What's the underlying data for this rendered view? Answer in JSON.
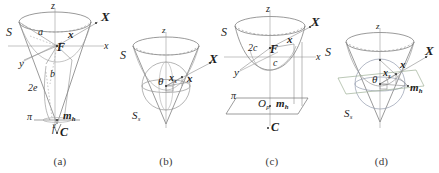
{
  "figure": {
    "background": "#ffffff",
    "ink": "#2b2b2b",
    "faint_ink": "#8f8f8f",
    "accent_blue": "#8fa6c4",
    "accent_green": "#a9bda4"
  },
  "panels": [
    {
      "id": "a",
      "caption": "(a)",
      "description": "Cone with apex at C, focus F, axes x, y, z, tangent sphere parameters a, b, 2e, and horizontal plane pi with m_h",
      "labels": [
        {
          "key": "z_axis",
          "text": "z",
          "style": "italic"
        },
        {
          "key": "x_axis",
          "text": "x",
          "style": "italic"
        },
        {
          "key": "y_axis",
          "text": "y",
          "style": "italic"
        },
        {
          "key": "S",
          "text": "S",
          "style": "italic"
        },
        {
          "key": "X",
          "text": "X",
          "style": "bold-italic"
        },
        {
          "key": "x_vec",
          "text": "x",
          "style": "bold-italic"
        },
        {
          "key": "F",
          "text": "F",
          "style": "bold-italic"
        },
        {
          "key": "a",
          "text": "a",
          "style": "italic"
        },
        {
          "key": "b",
          "text": "b",
          "style": "italic"
        },
        {
          "key": "two_e",
          "text": "2e",
          "style": "italic"
        },
        {
          "key": "pi",
          "text": "π",
          "style": "italic"
        },
        {
          "key": "m_h",
          "base": "m",
          "sub": "h",
          "style": "bold-italic"
        },
        {
          "key": "f",
          "text": "f",
          "style": "italic"
        },
        {
          "key": "C",
          "text": "C",
          "style": "bold-italic"
        }
      ]
    },
    {
      "id": "b",
      "caption": "(b)",
      "description": "Cone S with inscribed sphere S_s, half-angle theta, points x_s and x, direction X, axis z",
      "labels": [
        {
          "key": "z_axis",
          "text": "z",
          "style": "italic"
        },
        {
          "key": "S",
          "text": "S",
          "style": "italic"
        },
        {
          "key": "S_s",
          "base": "S",
          "sub": "s",
          "style": "italic"
        },
        {
          "key": "theta",
          "text": "θ",
          "style": "italic"
        },
        {
          "key": "x_s",
          "base": "x",
          "sub": "s",
          "style": "bold-italic"
        },
        {
          "key": "x_vec",
          "text": "x",
          "style": "bold-italic"
        },
        {
          "key": "X",
          "text": "X",
          "style": "bold-italic"
        }
      ]
    },
    {
      "id": "c",
      "caption": "(c)",
      "description": "Cone S with focus F, parameters 2c and c, axes x, y, z, plane pi containing O_p and m_h, apex C",
      "labels": [
        {
          "key": "z_axis",
          "text": "z",
          "style": "italic"
        },
        {
          "key": "x_axis",
          "text": "x",
          "style": "italic"
        },
        {
          "key": "y_axis",
          "text": "y",
          "style": "italic"
        },
        {
          "key": "S",
          "text": "S",
          "style": "italic"
        },
        {
          "key": "X",
          "text": "X",
          "style": "bold-italic"
        },
        {
          "key": "x_vec",
          "text": "x",
          "style": "bold-italic"
        },
        {
          "key": "F",
          "text": "F",
          "style": "bold-italic"
        },
        {
          "key": "two_c",
          "text": "2c",
          "style": "italic"
        },
        {
          "key": "c",
          "text": "c",
          "style": "italic"
        },
        {
          "key": "pi",
          "text": "π",
          "style": "italic"
        },
        {
          "key": "O_p",
          "base": "O",
          "sub": "p",
          "style": "italic"
        },
        {
          "key": "m_h",
          "base": "m",
          "sub": "h",
          "style": "bold-italic"
        },
        {
          "key": "C",
          "text": "C",
          "style": "bold-italic"
        }
      ]
    },
    {
      "id": "d",
      "caption": "(d)",
      "description": "Cone S with inscribed sphere S_s and plane, angle theta, points x_s, x, m_h, direction X, axis z",
      "labels": [
        {
          "key": "z_axis",
          "text": "z",
          "style": "italic"
        },
        {
          "key": "S",
          "text": "S",
          "style": "italic"
        },
        {
          "key": "S_s",
          "base": "S",
          "sub": "s",
          "style": "italic"
        },
        {
          "key": "theta",
          "text": "θ",
          "style": "italic"
        },
        {
          "key": "x_s",
          "base": "x",
          "sub": "s",
          "style": "bold-italic"
        },
        {
          "key": "x_vec",
          "text": "x",
          "style": "bold-italic"
        },
        {
          "key": "X",
          "text": "X",
          "style": "bold-italic"
        },
        {
          "key": "m_h",
          "base": "m",
          "sub": "h",
          "style": "bold-italic"
        }
      ]
    }
  ]
}
